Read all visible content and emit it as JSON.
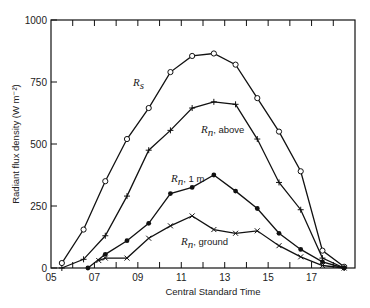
{
  "chart_data": {
    "type": "line",
    "title": "",
    "xlabel": "Central Standard Time",
    "ylabel": "Radiant flux density (W m⁻²)",
    "xlim": [
      5,
      19
    ],
    "ylim": [
      0,
      1000
    ],
    "x_ticks": [
      "05",
      "07",
      "09",
      "11",
      "13",
      "15",
      "17"
    ],
    "x_tick_values": [
      5,
      7,
      9,
      11,
      13,
      15,
      17
    ],
    "y_ticks": [
      "0",
      "250",
      "500",
      "750",
      "1000"
    ],
    "y_tick_values": [
      0,
      250,
      500,
      750,
      1000
    ],
    "grid": false,
    "legend": "inline labels",
    "series": [
      {
        "name": "R_s",
        "label_main": "R",
        "label_sub": "s",
        "label_suffix": "",
        "marker": "open-circle",
        "x": [
          5.5,
          6.5,
          7.5,
          8.5,
          9.5,
          10.5,
          11.5,
          12.5,
          13.5,
          14.5,
          15.5,
          16.5,
          17.5,
          18.5
        ],
        "values": [
          20,
          155,
          350,
          520,
          645,
          790,
          855,
          865,
          820,
          685,
          550,
          390,
          70,
          5
        ]
      },
      {
        "name": "R_n, above",
        "label_main": "R",
        "label_sub": "n",
        "label_suffix": ", above",
        "marker": "plus",
        "x": [
          5.5,
          6.5,
          7.5,
          8.5,
          9.5,
          10.5,
          11.5,
          12.5,
          13.5,
          14.5,
          15.5,
          16.5,
          17.5,
          18.5
        ],
        "values": [
          0,
          35,
          130,
          290,
          475,
          555,
          645,
          670,
          660,
          520,
          345,
          235,
          40,
          0
        ]
      },
      {
        "name": "R_n, 1 m",
        "label_main": "R",
        "label_sub": "n",
        "label_suffix": ", 1 m",
        "marker": "filled-circle",
        "x": [
          6.7,
          7.5,
          8.5,
          9.5,
          10.5,
          11.5,
          12.5,
          13.5,
          14.5,
          15.5,
          16.5,
          17.5,
          18.5
        ],
        "values": [
          0,
          55,
          110,
          180,
          300,
          325,
          375,
          310,
          240,
          140,
          75,
          25,
          0
        ]
      },
      {
        "name": "R_n, ground",
        "label_main": "R",
        "label_sub": "n",
        "label_suffix": ", ground",
        "marker": "x",
        "x": [
          7.2,
          7.5,
          8.5,
          9.5,
          10.5,
          11.5,
          12.5,
          13.5,
          14.5,
          15.5,
          16.5,
          17.5,
          18.5
        ],
        "values": [
          30,
          40,
          40,
          120,
          170,
          210,
          155,
          140,
          150,
          90,
          45,
          10,
          0
        ]
      }
    ]
  },
  "labels": {
    "rs": {
      "main": "R",
      "sub": "s",
      "suffix": ""
    },
    "rn_above": {
      "main": "R",
      "sub": "n",
      "suffix": ", above"
    },
    "rn_1m": {
      "main": "R",
      "sub": "n",
      "suffix": ", 1 m"
    },
    "rn_ground": {
      "main": "R",
      "sub": "n",
      "suffix": ", ground"
    }
  }
}
